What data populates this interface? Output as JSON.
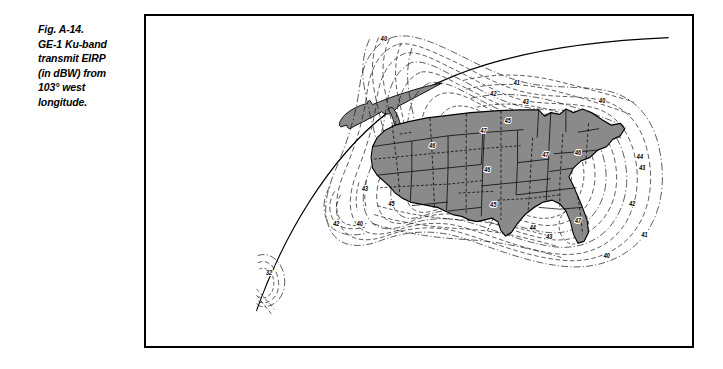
{
  "figure": {
    "caption_lines": [
      "Fig. A-14.",
      "GE-1 Ku-band",
      "transmit EIRP",
      "(in dBW) from",
      "103° west",
      "longitude."
    ],
    "caption_text": "Fig. A-14. GE-1 Ku-band transmit EIRP (in dBW) from 103° west longitude.",
    "figure_number": "A-14",
    "satellite": "GE-1",
    "band": "Ku-band",
    "quantity": "transmit EIRP",
    "units": "dBW",
    "orbital_slot": "103° west longitude"
  },
  "colors": {
    "landmass_fill": "#8a8a8a",
    "coastline_fill": "#8a8a8a",
    "outline": "#000000",
    "contour": "#1a1a1a",
    "background": "#ffffff",
    "frame": "#000000"
  },
  "chart_data": {
    "type": "contour_map",
    "title": "GE-1 Ku-band transmit EIRP (in dBW) from 103° west longitude",
    "units": "dBW",
    "quantity": "EIRP",
    "level_values": [
      32,
      40,
      41,
      42,
      43,
      44,
      45,
      46,
      47
    ],
    "peak_value": 47,
    "minimum_labeled_value": 32,
    "contour_interval": 1,
    "region": "Continental United States",
    "labels": [
      {
        "text": "40",
        "x": 315,
        "y": 28
      },
      {
        "text": "41",
        "x": 491,
        "y": 77
      },
      {
        "text": "42",
        "x": 460,
        "y": 89
      },
      {
        "text": "43",
        "x": 503,
        "y": 98
      },
      {
        "text": "40",
        "x": 604,
        "y": 97
      },
      {
        "text": "45",
        "x": 479,
        "y": 120
      },
      {
        "text": "47",
        "x": 447,
        "y": 131
      },
      {
        "text": "46",
        "x": 379,
        "y": 148
      },
      {
        "text": "46",
        "x": 572,
        "y": 155
      },
      {
        "text": "44",
        "x": 654,
        "y": 160
      },
      {
        "text": "47",
        "x": 529,
        "y": 158
      },
      {
        "text": "46",
        "x": 452,
        "y": 175
      },
      {
        "text": "43",
        "x": 657,
        "y": 172
      },
      {
        "text": "45",
        "x": 325,
        "y": 212
      },
      {
        "text": "45",
        "x": 460,
        "y": 214
      },
      {
        "text": "42",
        "x": 644,
        "y": 213
      },
      {
        "text": "43",
        "x": 290,
        "y": 196
      },
      {
        "text": "44",
        "x": 512,
        "y": 239
      },
      {
        "text": "43",
        "x": 534,
        "y": 249
      },
      {
        "text": "47",
        "x": 572,
        "y": 231
      },
      {
        "text": "42",
        "x": 252,
        "y": 235
      },
      {
        "text": "40",
        "x": 283,
        "y": 235
      },
      {
        "text": "41",
        "x": 660,
        "y": 247
      },
      {
        "text": "40",
        "x": 610,
        "y": 271
      },
      {
        "text": "32",
        "x": 163,
        "y": 290
      }
    ]
  },
  "map": {
    "features": [
      "earth-limb-arc",
      "canadian-coastline",
      "conus-landmass",
      "state-boundaries",
      "eirp-contours"
    ],
    "projection_note": "view from geostationary orbit at 103° W"
  }
}
